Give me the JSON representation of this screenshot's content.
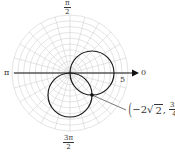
{
  "chart_data": {
    "type": "polar",
    "title": "",
    "curves": [
      {
        "name": "r = 4cos θ",
        "description": "circle of diameter 4 centered on polar axis (right of pole)",
        "center_rect": [
          2,
          0
        ],
        "radius": 2
      },
      {
        "name": "r = -4sin θ",
        "description": "circle of diameter 4 centered below pole",
        "center_rect": [
          0,
          -2
        ],
        "radius": 2
      }
    ],
    "intersection_points": [
      {
        "label_r": "−2√2",
        "label_theta": "3π/4",
        "rect": [
          2,
          -2
        ]
      },
      {
        "label_r": "0",
        "label_theta": "pole",
        "rect": [
          0,
          0
        ]
      }
    ],
    "grid": {
      "rings": 10,
      "ring_step": 0.5,
      "max_r": 5,
      "spoke_step_deg": 15
    },
    "angle_labels": {
      "top": {
        "num": "π",
        "den": "2"
      },
      "left": "π",
      "right": "0",
      "bottom": {
        "num": "3π",
        "den": "2"
      }
    },
    "r_tick_label": "5"
  },
  "labels": {
    "top_num": "π",
    "top_den": "2",
    "left": "π",
    "right": "0",
    "bottom_num": "3π",
    "bottom_den": "2",
    "r_tick": "5",
    "point": {
      "r_prefix": "−2",
      "r_sqrt": "2",
      "comma": ",",
      "theta_num": "3π",
      "theta_den": "4"
    }
  },
  "colors": {
    "grid": "#d2d2d2",
    "curve": "#1a1a1a",
    "axis": "#111111",
    "leader": "#555555"
  }
}
